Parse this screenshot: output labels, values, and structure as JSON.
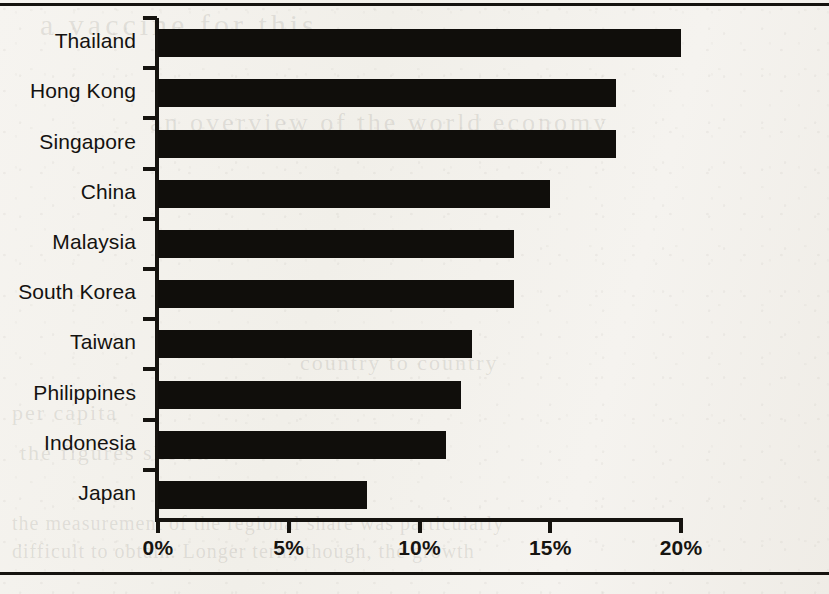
{
  "page": {
    "background_color": "#f4f2ee",
    "rule_color": "#15130f",
    "bleed_through_text": [
      {
        "text": "a vaccine for this"
      },
      {
        "text": "an overview of the world economy"
      },
      {
        "text": "country to country"
      },
      {
        "text": "per capita"
      },
      {
        "text": "the figures shown"
      },
      {
        "text": "the measurement of the regional share was particularly"
      },
      {
        "text": "difficult to obtain. Longer term, though, the growth"
      }
    ]
  },
  "chart_data": {
    "type": "bar",
    "orientation": "horizontal",
    "title": "",
    "subtitle": "",
    "xlabel": "",
    "ylabel": "",
    "categories": [
      "Thailand",
      "Hong Kong",
      "Singapore",
      "China",
      "Malaysia",
      "South Korea",
      "Taiwan",
      "Philippines",
      "Indonesia",
      "Japan"
    ],
    "values": [
      20.0,
      17.5,
      17.5,
      15.0,
      13.6,
      13.6,
      12.0,
      11.6,
      11.0,
      8.0
    ],
    "value_unit": "%",
    "xlim": [
      0,
      20
    ],
    "xticks": [
      0,
      5,
      10,
      15,
      20
    ],
    "xtick_labels": [
      "0%",
      "5%",
      "10%",
      "15%",
      "20%"
    ],
    "grid": false,
    "legend": false,
    "legend_position": "none",
    "bar_color": "#100e0b",
    "axis_color": "#15130f",
    "label_color": "#141210"
  }
}
